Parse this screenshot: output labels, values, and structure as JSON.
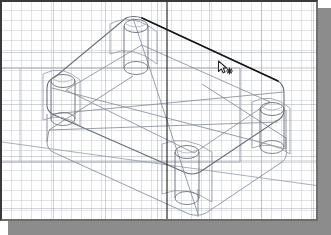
{
  "application": {
    "window_title": "",
    "viewport_background": "#ffffff",
    "border_color": "#3a3a3a",
    "shadow_color": "#8c8c8c"
  },
  "viewport": {
    "grid": {
      "visible": true,
      "minor_spacing_px": 10,
      "major_spacing_px": 52,
      "color": "#969ba5"
    },
    "cursor": {
      "icon": "arrow-snap-crosshair-cursor",
      "x": 215,
      "y": 58,
      "color": "#4a4a4a"
    },
    "construction_line_vertical": {
      "name": "work-axis-vertical",
      "x": 165,
      "color": "#2b2b2b"
    },
    "construction_plane": {
      "name": "work-plane-rectangle",
      "color": "#9aa0ab"
    }
  },
  "model": {
    "name": "corner-bracket-plate",
    "type": "isometric-wireframe",
    "line_color": "#6b7280",
    "highlight_color": "#1d1d1d",
    "features": [
      {
        "label": "plate-top-face"
      },
      {
        "label": "plate-bottom-face"
      },
      {
        "label": "boss-cylinder-top"
      },
      {
        "label": "boss-cylinder-left"
      },
      {
        "label": "boss-cylinder-right"
      },
      {
        "label": "boss-cylinder-bottom"
      },
      {
        "label": "selected-edge-top-right"
      }
    ]
  },
  "chart_data": {
    "type": "scatter",
    "title": "",
    "xlabel": "",
    "ylabel": ""
  }
}
